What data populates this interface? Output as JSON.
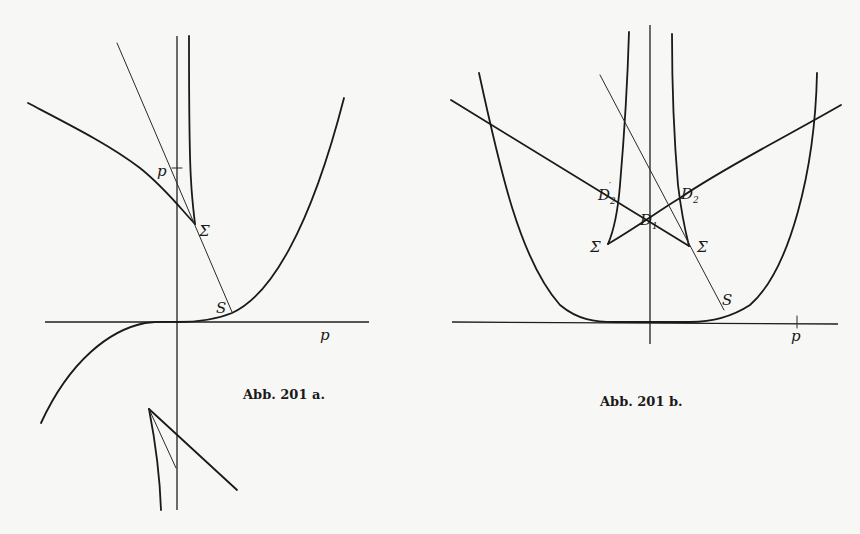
{
  "figures": [
    {
      "id": "a",
      "caption": "Abb. 201 a.",
      "labels": {
        "p_axis": "p",
        "p_point": "p",
        "sigma": "Σ",
        "s": "S"
      }
    },
    {
      "id": "b",
      "caption": "Abb. 201 b.",
      "labels": {
        "p_axis": "p",
        "d2_prime": "D",
        "d2_prime_sub": "2",
        "d2_prime_mark": "′",
        "d2": "D",
        "d2_sub": "2",
        "d1": "D",
        "d1_sub": "1",
        "sigma_left": "Σ",
        "sigma_right": "Σ",
        "s": "S"
      }
    }
  ],
  "colors": {
    "ink": "#1a1a1a",
    "paper": "#f7f7f5"
  }
}
